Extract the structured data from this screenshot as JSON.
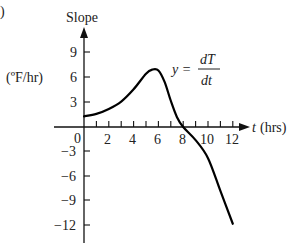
{
  "panel_label": ")",
  "chart_data": {
    "type": "line",
    "title": "",
    "equation": {
      "lhs": "y =",
      "num": "dT",
      "den": "dt"
    },
    "ylabel_top": "Slope",
    "ylabel_units": "(ºF/hr)",
    "xlabel_var": "t",
    "xlabel_units": "(hrs)",
    "x_ticks": [
      2,
      4,
      6,
      8,
      10,
      12
    ],
    "x_tick_labels": [
      "2",
      "4",
      "6",
      "8",
      "10",
      "12"
    ],
    "y_ticks": [
      9,
      6,
      3,
      -3,
      -6,
      -9,
      -12
    ],
    "y_tick_labels": [
      "9",
      "6",
      "3",
      "−3",
      "−6",
      "−9",
      "−12"
    ],
    "origin_label": "0",
    "xlim": [
      0,
      13
    ],
    "ylim": [
      -14,
      11
    ],
    "grid": false,
    "series": [
      {
        "name": "dT/dt",
        "x": [
          0,
          1,
          2,
          3,
          4,
          5,
          5.5,
          6,
          6.5,
          7,
          7.5,
          8,
          9,
          10,
          11,
          12
        ],
        "y": [
          1.3,
          1.6,
          2.2,
          3.1,
          4.6,
          6.5,
          7.0,
          6.9,
          5.5,
          3.2,
          1.2,
          0,
          -1.6,
          -3.8,
          -7.8,
          -11.8
        ]
      }
    ]
  }
}
